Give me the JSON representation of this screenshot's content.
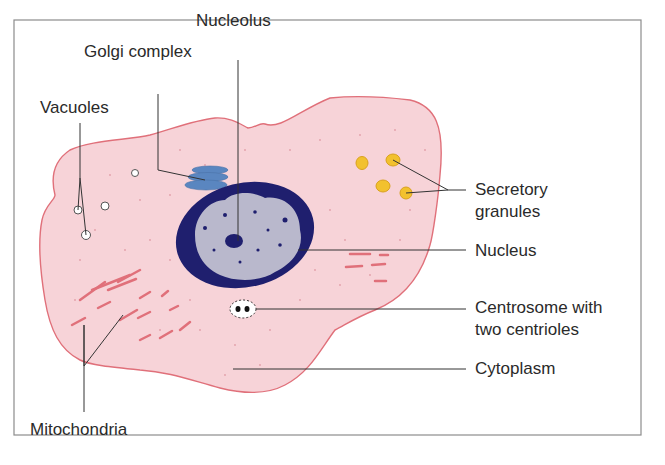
{
  "figure": {
    "colors": {
      "frame": "#8c8c8c",
      "cytoplasm_fill": "#f7d3d8",
      "cell_membrane": "#e0707a",
      "nucleus_envelope": "#1f1f6e",
      "nucleoplasm": "#b9b8cc",
      "golgi": "#5a86c0",
      "secretory_granule": "#f2c12e",
      "mitochondria": "#e0707a",
      "leader_line": "#333333",
      "label_text": "#2a2a2a"
    }
  },
  "labels": {
    "nucleolus": "Nucleolus",
    "golgi": "Golgi complex",
    "vacuoles": "Vacuoles",
    "secretory_line1": "Secretory",
    "secretory_line2": "granules",
    "nucleus": "Nucleus",
    "centrosome_line1": "Centrosome with",
    "centrosome_line2": "two centrioles",
    "cytoplasm": "Cytoplasm",
    "mitochondria": "Mitochondria"
  }
}
